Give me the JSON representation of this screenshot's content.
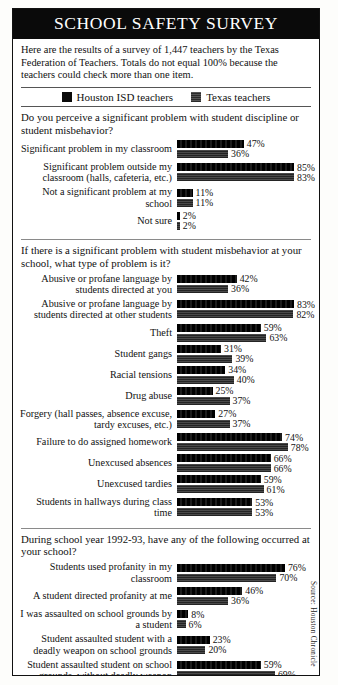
{
  "title": "SCHOOL SAFETY SURVEY",
  "intro": "Here are the results of a survey of 1,447 teachers by the Texas Federation of Teachers. Totals do not equal 100% because the teachers could check more than one item.",
  "legend": {
    "series": [
      {
        "name": "houston-isd",
        "label": "Houston ISD teachers",
        "color": "#0b0b0b"
      },
      {
        "name": "texas",
        "label": "Texas teachers",
        "color": "#3a3a3a"
      }
    ]
  },
  "source": "Source: Houston Chronicle",
  "sections": [
    {
      "question": "Do you perceive a significant problem with student discipline or student misbehavior?",
      "rows": [
        {
          "label": "Significant problem in my classroom",
          "hisd": 47,
          "tx": 36
        },
        {
          "label": "Significant problem outside my classroom (halls, cafeteria, etc.)",
          "hisd": 85,
          "tx": 83
        },
        {
          "label": "Not a significant problem at my school",
          "hisd": 11,
          "tx": 11
        },
        {
          "label": "Not sure",
          "hisd": 2,
          "tx": 2
        }
      ]
    },
    {
      "question": "If there is a significant problem with student misbehavior at your school, what type of problem is it?",
      "rows": [
        {
          "label": "Abusive or profane language by students directed at you",
          "hisd": 42,
          "tx": 36
        },
        {
          "label": "Abusive or profane language by students directed at other students",
          "hisd": 83,
          "tx": 82
        },
        {
          "label": "Theft",
          "hisd": 59,
          "tx": 63
        },
        {
          "label": "Student gangs",
          "hisd": 31,
          "tx": 39
        },
        {
          "label": "Racial tensions",
          "hisd": 34,
          "tx": 40
        },
        {
          "label": "Drug abuse",
          "hisd": 25,
          "tx": 37
        },
        {
          "label": "Forgery (hall passes, absence excuse, tardy excuses, etc.)",
          "hisd": 27,
          "tx": 37
        },
        {
          "label": "Failure to do assigned homework",
          "hisd": 74,
          "tx": 78
        },
        {
          "label": "Unexcused absences",
          "hisd": 66,
          "tx": 66
        },
        {
          "label": "Unexcused tardies",
          "hisd": 59,
          "tx": 61
        },
        {
          "label": "Students in hallways during class time",
          "hisd": 53,
          "tx": 53
        }
      ]
    },
    {
      "question": "During school year 1992-93, have any of the following occurred at your school?",
      "rows": [
        {
          "label": "Students used profanity in my classroom",
          "hisd": 76,
          "tx": 70
        },
        {
          "label": "A student directed profanity at me",
          "hisd": 46,
          "tx": 36
        },
        {
          "label": "I was assaulted on school grounds by a student",
          "hisd": 8,
          "tx": 6
        },
        {
          "label": "Student assaulted student with a deadly weapon on school grounds",
          "hisd": 23,
          "tx": 20
        },
        {
          "label": "Student assaulted student on school grounds, without deadly weapon",
          "hisd": 59,
          "tx": 69
        },
        {
          "label": "My personal property was vandalized",
          "hisd": 26,
          "tx": 23
        },
        {
          "label": "My personal property was stolen",
          "hisd": 39,
          "tx": 34
        }
      ]
    }
  ],
  "chart_data": {
    "type": "bar",
    "title": "SCHOOL SAFETY SURVEY",
    "orientation": "horizontal",
    "xlabel": "",
    "ylabel": "",
    "xlim": [
      0,
      100
    ],
    "unit": "%",
    "grid": false,
    "legend_position": "top",
    "series_names": [
      "Houston ISD teachers",
      "Texas teachers"
    ],
    "panels": [
      {
        "title": "Do you perceive a significant problem with student discipline or student misbehavior?",
        "categories": [
          "Significant problem in my classroom",
          "Significant problem outside my classroom (halls, cafeteria, etc.)",
          "Not a significant problem at my school",
          "Not sure"
        ],
        "series": [
          {
            "name": "Houston ISD teachers",
            "values": [
              47,
              85,
              11,
              2
            ]
          },
          {
            "name": "Texas teachers",
            "values": [
              36,
              83,
              11,
              2
            ]
          }
        ]
      },
      {
        "title": "If there is a significant problem with student misbehavior at your school, what type of problem is it?",
        "categories": [
          "Abusive or profane language by students directed at you",
          "Abusive or profane language by students directed at other students",
          "Theft",
          "Student gangs",
          "Racial tensions",
          "Drug abuse",
          "Forgery (hall passes, absence excuse, tardy excuses, etc.)",
          "Failure to do assigned homework",
          "Unexcused absences",
          "Unexcused tardies",
          "Students in hallways during class time"
        ],
        "series": [
          {
            "name": "Houston ISD teachers",
            "values": [
              42,
              83,
              59,
              31,
              34,
              25,
              27,
              74,
              66,
              59,
              53
            ]
          },
          {
            "name": "Texas teachers",
            "values": [
              36,
              82,
              63,
              39,
              40,
              37,
              37,
              78,
              66,
              61,
              53
            ]
          }
        ]
      },
      {
        "title": "During school year 1992-93, have any of the following occurred at your school?",
        "categories": [
          "Students used profanity in my classroom",
          "A student directed profanity at me",
          "I was assaulted on school grounds by a student",
          "Student assaulted student with a deadly weapon on school grounds",
          "Student assaulted student on school grounds, without deadly weapon",
          "My personal property was vandalized",
          "My personal property was stolen"
        ],
        "series": [
          {
            "name": "Houston ISD teachers",
            "values": [
              76,
              46,
              8,
              23,
              59,
              26,
              39
            ]
          },
          {
            "name": "Texas teachers",
            "values": [
              70,
              36,
              6,
              20,
              69,
              23,
              34
            ]
          }
        ]
      }
    ]
  }
}
